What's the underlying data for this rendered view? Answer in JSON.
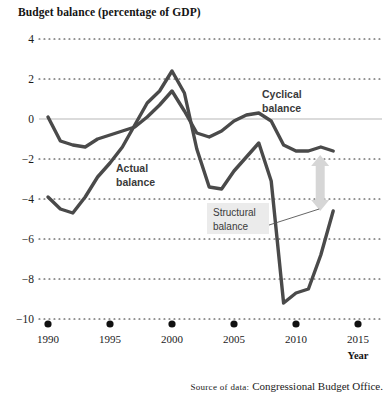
{
  "chart_data": {
    "type": "line",
    "title": "Budget balance (percentage of GDP)",
    "xlabel": "Year",
    "ylabel": "",
    "xlim": [
      1990,
      2015
    ],
    "ylim": [
      -10,
      4
    ],
    "grid": true,
    "legend_position": "inline-annotations",
    "xticks": [
      "1990",
      "1995",
      "2000",
      "2005",
      "2010",
      "2015"
    ],
    "xtick_values": [
      1990,
      1995,
      2000,
      2005,
      2010,
      2015
    ],
    "yticks": [
      "4",
      "2",
      "0",
      "−2",
      "−4",
      "−6",
      "−8",
      "−10"
    ],
    "ytick_values": [
      4,
      2,
      0,
      -2,
      -4,
      -6,
      -8,
      -10
    ],
    "x": [
      1990,
      1991,
      1992,
      1993,
      1994,
      1995,
      1996,
      1997,
      1998,
      1999,
      2000,
      2001,
      2002,
      2003,
      2004,
      2005,
      2006,
      2007,
      2008,
      2009,
      2010,
      2011,
      2012,
      2013
    ],
    "series": [
      {
        "name": "Cyclical balance",
        "color": "#4a4a4a",
        "values": [
          0.1,
          -1.1,
          -1.3,
          -1.4,
          -1.0,
          -0.8,
          -0.6,
          -0.4,
          0.1,
          0.7,
          1.4,
          0.4,
          -0.7,
          -0.9,
          -0.6,
          -0.1,
          0.2,
          0.3,
          -0.1,
          -1.3,
          -1.6,
          -1.6,
          -1.4,
          -1.6
        ]
      },
      {
        "name": "Actual balance",
        "color": "#4a4a4a",
        "values": [
          -3.9,
          -4.5,
          -4.7,
          -3.9,
          -2.9,
          -2.2,
          -1.4,
          -0.3,
          0.8,
          1.4,
          2.4,
          1.3,
          -1.5,
          -3.4,
          -3.5,
          -2.6,
          -1.9,
          -1.2,
          -3.1,
          -9.2,
          -8.7,
          -8.5,
          -6.8,
          -4.6
        ]
      }
    ],
    "annotations": [
      {
        "name": "cyclical-balance-label",
        "text_line1": "Cyclical",
        "text_line2": "balance",
        "x": 262,
        "y": 98
      },
      {
        "name": "actual-balance-label",
        "text_line1": "Actual",
        "text_line2": "balance",
        "x": 116,
        "y": 172
      },
      {
        "name": "structural-balance-label",
        "text_line1": "Structural",
        "text_line2": "balance",
        "x": 213,
        "y": 216
      }
    ],
    "gap_arrow": {
      "name": "structural-gap-arrow",
      "color": "#d6d6d6",
      "from_value": -1.8,
      "to_value": -4.6,
      "x_value": 2013
    }
  },
  "source": {
    "prefix": "Source of data:",
    "text": "Congressional Budget Office."
  }
}
